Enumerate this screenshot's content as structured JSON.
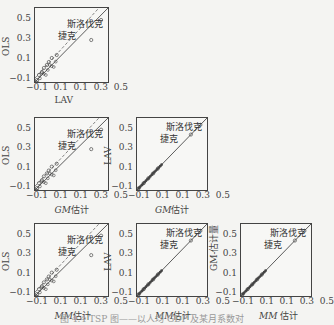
{
  "chart_data": [
    {
      "type": "scatter",
      "row": 1,
      "col": 1,
      "xlabel": "LAV",
      "ylabel": "OLS",
      "xticks": [
        "−0.1",
        "0.1",
        "0.1",
        "0.3",
        "0.5"
      ],
      "yticks": [
        "0.5",
        "0.3",
        "0.1",
        "−0.1"
      ],
      "annotations": [
        "斯洛伐克",
        "捷克"
      ],
      "lines": [
        "solid 45° line",
        "dashed fitted line"
      ],
      "points": [
        [
          -0.1,
          -0.1
        ],
        [
          -0.08,
          -0.05
        ],
        [
          -0.05,
          -0.02
        ],
        [
          -0.03,
          0.02
        ],
        [
          0.0,
          0.05
        ],
        [
          0.02,
          0.08
        ],
        [
          0.05,
          0.12
        ],
        [
          0.1,
          0.15
        ],
        [
          0.45,
          0.3
        ],
        [
          0.55,
          0.5
        ]
      ]
    },
    {
      "type": "scatter",
      "row": 2,
      "col": 1,
      "xlabel": "GM估计",
      "ylabel": "OLS",
      "xticks": [
        "−0.1",
        "0.1",
        "0.1",
        "0.3",
        "0.5"
      ],
      "yticks": [
        "0.5",
        "0.3",
        "0.1",
        "−0.1"
      ],
      "annotations": [
        "斯洛伐克",
        "捷克"
      ],
      "lines": [
        "solid 45° line",
        "dashed fitted line"
      ],
      "points": [
        [
          -0.1,
          -0.1
        ],
        [
          -0.08,
          -0.05
        ],
        [
          -0.05,
          -0.02
        ],
        [
          -0.03,
          0.02
        ],
        [
          0.0,
          0.05
        ],
        [
          0.02,
          0.08
        ],
        [
          0.05,
          0.12
        ],
        [
          0.1,
          0.15
        ],
        [
          0.45,
          0.3
        ],
        [
          0.55,
          0.5
        ]
      ]
    },
    {
      "type": "scatter",
      "row": 2,
      "col": 2,
      "xlabel": "GM估计",
      "ylabel": "LAV",
      "xticks": [
        "−0.1",
        "0.1",
        "0.1",
        "0.3",
        "0.5"
      ],
      "yticks": [
        "0.5",
        "0.3",
        "0.1",
        "−0.1"
      ],
      "annotations": [
        "斯洛伐克",
        "捷克"
      ],
      "lines": [
        "solid 45° line"
      ],
      "points": [
        [
          -0.1,
          -0.1
        ],
        [
          -0.05,
          -0.05
        ],
        [
          0.0,
          0.0
        ],
        [
          0.05,
          0.05
        ],
        [
          0.1,
          0.1
        ],
        [
          0.45,
          0.45
        ],
        [
          0.55,
          0.55
        ]
      ]
    },
    {
      "type": "scatter",
      "row": 3,
      "col": 1,
      "xlabel": "MM估计",
      "ylabel": "OLS",
      "xticks": [
        "−0.1",
        "0.1",
        "0.1",
        "0.3",
        "0.5"
      ],
      "yticks": [
        "0.5",
        "0.3",
        "0.1",
        "−0.1"
      ],
      "annotations": [
        "斯洛伐克",
        "捷克"
      ],
      "lines": [
        "solid 45° line",
        "dashed fitted line"
      ],
      "points": [
        [
          -0.1,
          -0.1
        ],
        [
          -0.08,
          -0.05
        ],
        [
          -0.05,
          -0.02
        ],
        [
          -0.03,
          0.02
        ],
        [
          0.0,
          0.05
        ],
        [
          0.02,
          0.08
        ],
        [
          0.05,
          0.12
        ],
        [
          0.1,
          0.15
        ],
        [
          0.45,
          0.3
        ],
        [
          0.55,
          0.5
        ]
      ]
    },
    {
      "type": "scatter",
      "row": 3,
      "col": 2,
      "xlabel": "MM估计",
      "ylabel": "LAV",
      "xticks": [
        "−0.1",
        "0.1",
        "0.1",
        "0.3",
        "0.5"
      ],
      "yticks": [
        "0.5",
        "0.3",
        "0.1",
        "−0.1"
      ],
      "annotations": [
        "斯洛伐克",
        "捷克"
      ],
      "lines": [
        "solid 45° line"
      ],
      "points": [
        [
          -0.1,
          -0.1
        ],
        [
          -0.05,
          -0.05
        ],
        [
          0.0,
          0.0
        ],
        [
          0.05,
          0.05
        ],
        [
          0.1,
          0.1
        ],
        [
          0.45,
          0.45
        ],
        [
          0.55,
          0.55
        ]
      ]
    },
    {
      "type": "scatter",
      "row": 3,
      "col": 3,
      "xlabel": "MM 估计",
      "ylabel": "GM-估计量",
      "xticks": [
        "−0.1",
        "0.1",
        "0.1",
        "0.3",
        "0.5"
      ],
      "yticks": [
        "0.5",
        "0.3",
        "0.1",
        "−0.1"
      ],
      "annotations": [
        "斯洛伐克",
        "捷克"
      ],
      "lines": [
        "solid 45° line"
      ],
      "points": [
        [
          -0.1,
          -0.1
        ],
        [
          -0.05,
          -0.05
        ],
        [
          0.0,
          0.0
        ],
        [
          0.05,
          0.05
        ],
        [
          0.1,
          0.1
        ],
        [
          0.45,
          0.45
        ],
        [
          0.55,
          0.55
        ]
      ]
    }
  ],
  "labels": {
    "p11": {
      "x": "LAV",
      "y": "OLS"
    },
    "p21": {
      "x_it": "GM",
      "x_rest": "估计",
      "y": "OLS"
    },
    "p22": {
      "x_it": "GM",
      "x_rest": "估计",
      "y": "LAV"
    },
    "p31": {
      "x_it": "MM",
      "x_rest": "估计",
      "y": "OLS"
    },
    "p32": {
      "x_it": "MM",
      "x_rest": "估计",
      "y": "LAV"
    },
    "p33": {
      "x_it": "MM",
      "x_rest": " 估计",
      "y": "GM-估计量"
    }
  },
  "ticks": {
    "y": [
      "0.5",
      "0.3",
      "0.1",
      "−0.1"
    ],
    "x": "−0.1  0.1  0.1  0.3  0.5"
  },
  "annotations": {
    "slovakia": "斯洛伐克",
    "czech": "捷克"
  },
  "caption": "图 4.4  TSP 图——以人均 GDP 及某月系数对"
}
